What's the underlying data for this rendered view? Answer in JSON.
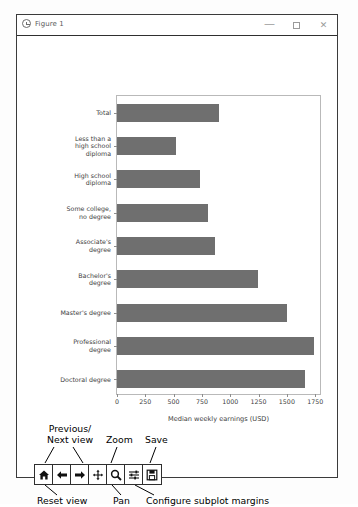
{
  "window": {
    "title": "Figure 1",
    "icon": "figure-clock-icon",
    "controls": {
      "minimize": "—",
      "maximize": "□",
      "close": "✕"
    }
  },
  "chart_data": {
    "type": "bar",
    "orientation": "horizontal",
    "title": "",
    "xlabel": "Median weekly earnings (USD)",
    "ylabel": "",
    "categories": [
      "Total",
      "Less than a\nhigh school\ndiploma",
      "High school\ndiploma",
      "Some college,\nno degree",
      "Associate's\ndegree",
      "Bachelor's\ndegree",
      "Master's degree",
      "Professional\ndegree",
      "Doctoral degree"
    ],
    "values": [
      899,
      520,
      730,
      802,
      862,
      1248,
      1497,
      1736,
      1661
    ],
    "xlim": [
      0,
      1810
    ],
    "xticks": [
      0,
      250,
      500,
      750,
      1000,
      1250,
      1500,
      1750
    ],
    "xticklabels": [
      "0",
      "250",
      "500",
      "750",
      "1000",
      "1250",
      "1500",
      "1750"
    ],
    "grid": false,
    "legend": null,
    "bar_color": "#6f6f6f"
  },
  "toolbar": {
    "buttons": [
      {
        "name": "home",
        "icon": "home-icon"
      },
      {
        "name": "back",
        "icon": "arrow-left-icon"
      },
      {
        "name": "forward",
        "icon": "arrow-right-icon"
      },
      {
        "name": "pan",
        "icon": "move-cross-icon"
      },
      {
        "name": "zoom",
        "icon": "magnifier-icon"
      },
      {
        "name": "configure",
        "icon": "sliders-icon"
      },
      {
        "name": "save",
        "icon": "floppy-disk-icon"
      }
    ]
  },
  "annotations": {
    "previous_next_view": "Previous/\nNext view",
    "zoom": "Zoom",
    "save": "Save",
    "reset_view": "Reset view",
    "pan": "Pan",
    "configure_subplot_margins": "Configure subplot margins"
  }
}
